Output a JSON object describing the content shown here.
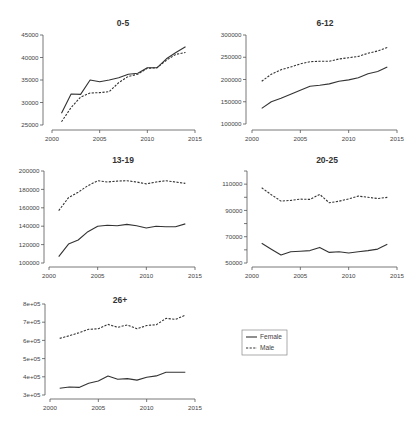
{
  "colors": {
    "background": "#ffffff",
    "line": "#333333",
    "axis": "#555555",
    "text": "#333333"
  },
  "legend": {
    "entries": [
      {
        "label": "Female",
        "style": "solid"
      },
      {
        "label": "Male",
        "style": "dashed"
      }
    ]
  },
  "chart_data": [
    {
      "type": "line",
      "title": "0-5",
      "xlabel": "",
      "ylabel": "",
      "x": [
        2001,
        2002,
        2003,
        2004,
        2005,
        2006,
        2007,
        2008,
        2009,
        2010,
        2011,
        2012,
        2013,
        2014
      ],
      "series": [
        {
          "name": "Female",
          "style": "solid",
          "values": [
            27600,
            31900,
            31800,
            35000,
            34600,
            35000,
            35500,
            36300,
            36500,
            37700,
            37700,
            39700,
            41100,
            42400
          ]
        },
        {
          "name": "Male",
          "style": "dashed",
          "values": [
            25700,
            28900,
            31200,
            32100,
            32200,
            32400,
            34400,
            35800,
            36300,
            37600,
            37700,
            39400,
            40700,
            41100
          ]
        }
      ],
      "xlim": [
        2000,
        2015
      ],
      "ylim": [
        25000,
        45000
      ],
      "x_ticks": [
        2000,
        2005,
        2010,
        2015
      ],
      "x_tick_labels": [
        "2000",
        "2005",
        "2010",
        "2015"
      ],
      "y_ticks": [
        25000,
        30000,
        35000,
        40000,
        45000
      ],
      "y_tick_labels": [
        "25000",
        "30000",
        "35000",
        "40000",
        "45000"
      ],
      "grid": false
    },
    {
      "type": "line",
      "title": "6-12",
      "xlabel": "",
      "ylabel": "",
      "x": [
        2001,
        2002,
        2003,
        2004,
        2005,
        2006,
        2007,
        2008,
        2009,
        2010,
        2011,
        2012,
        2013,
        2014
      ],
      "series": [
        {
          "name": "Female",
          "style": "solid",
          "values": [
            135000,
            150000,
            158000,
            167000,
            176000,
            185000,
            187000,
            190000,
            196000,
            199000,
            204000,
            213000,
            218000,
            228000
          ]
        },
        {
          "name": "Male",
          "style": "dashed",
          "values": [
            196000,
            212000,
            222000,
            228000,
            235000,
            240000,
            241000,
            241000,
            246000,
            249000,
            252000,
            259000,
            264000,
            272000
          ]
        }
      ],
      "xlim": [
        2000,
        2015
      ],
      "ylim": [
        100000,
        300000
      ],
      "x_ticks": [
        2000,
        2005,
        2010,
        2015
      ],
      "x_tick_labels": [
        "2000",
        "2005",
        "2010",
        "2015"
      ],
      "y_ticks": [
        100000,
        150000,
        200000,
        250000,
        300000
      ],
      "y_tick_labels": [
        "100000",
        "150000",
        "200000",
        "250000",
        "300000"
      ],
      "grid": false
    },
    {
      "type": "line",
      "title": "13-19",
      "xlabel": "",
      "ylabel": "",
      "x": [
        2001,
        2002,
        2003,
        2004,
        2005,
        2006,
        2007,
        2008,
        2009,
        2010,
        2011,
        2012,
        2013,
        2014
      ],
      "series": [
        {
          "name": "Female",
          "style": "solid",
          "values": [
            107000,
            120500,
            125000,
            134000,
            140000,
            141000,
            140500,
            142000,
            140500,
            138000,
            140000,
            139500,
            139500,
            142500
          ]
        },
        {
          "name": "Male",
          "style": "dashed",
          "values": [
            157000,
            171000,
            177000,
            184000,
            189500,
            188000,
            189000,
            189500,
            188000,
            186000,
            188000,
            189500,
            188000,
            186500
          ]
        }
      ],
      "xlim": [
        2000,
        2015
      ],
      "ylim": [
        100000,
        200000
      ],
      "x_ticks": [
        2000,
        2005,
        2010,
        2015
      ],
      "x_tick_labels": [
        "2000",
        "2005",
        "2010",
        "2015"
      ],
      "y_ticks": [
        100000,
        120000,
        140000,
        160000,
        180000,
        200000
      ],
      "y_tick_labels": [
        "100000",
        "120000",
        "140000",
        "160000",
        "180000",
        "200000"
      ],
      "grid": false
    },
    {
      "type": "line",
      "title": "20-25",
      "xlabel": "",
      "ylabel": "",
      "x": [
        2001,
        2002,
        2003,
        2004,
        2005,
        2006,
        2007,
        2008,
        2009,
        2010,
        2011,
        2012,
        2013,
        2014
      ],
      "series": [
        {
          "name": "Female",
          "style": "solid",
          "values": [
            65000,
            60500,
            56100,
            58600,
            59000,
            59400,
            61900,
            58100,
            58600,
            57600,
            58500,
            59400,
            60600,
            64200
          ]
        },
        {
          "name": "Male",
          "style": "dashed",
          "values": [
            107200,
            102000,
            97100,
            97600,
            98600,
            98400,
            102200,
            95800,
            97000,
            98800,
            100900,
            100000,
            99100,
            99900
          ]
        }
      ],
      "xlim": [
        2000,
        2015
      ],
      "ylim": [
        50000,
        120000
      ],
      "x_ticks": [
        2000,
        2005,
        2010,
        2015
      ],
      "x_tick_labels": [
        "2000",
        "2005",
        "2010",
        "2015"
      ],
      "y_ticks": [
        50000,
        60000,
        70000,
        80000,
        90000,
        100000,
        110000,
        120000
      ],
      "y_tick_labels": [
        "50000",
        "",
        "70000",
        "",
        "90000",
        "",
        "110000",
        ""
      ],
      "grid": false
    },
    {
      "type": "line",
      "title": "26+",
      "xlabel": "",
      "ylabel": "",
      "x": [
        2001,
        2002,
        2003,
        2004,
        2005,
        2006,
        2007,
        2008,
        2009,
        2010,
        2011,
        2012,
        2013,
        2014
      ],
      "series": [
        {
          "name": "Female",
          "style": "solid",
          "values": [
            337000,
            344000,
            342000,
            365000,
            377000,
            404000,
            386000,
            390000,
            382000,
            397000,
            405000,
            425000,
            425000,
            425000
          ]
        },
        {
          "name": "Male",
          "style": "dashed",
          "values": [
            611000,
            626000,
            642000,
            661000,
            664000,
            688000,
            672000,
            685000,
            664000,
            682000,
            686000,
            721000,
            716000,
            739000
          ]
        }
      ],
      "xlim": [
        2000,
        2015
      ],
      "ylim": [
        300000,
        800000
      ],
      "x_ticks": [
        2000,
        2005,
        2010,
        2015
      ],
      "x_tick_labels": [
        "2000",
        "2005",
        "2010",
        "2015"
      ],
      "y_ticks": [
        300000,
        400000,
        500000,
        600000,
        700000,
        800000
      ],
      "y_tick_labels": [
        "3e+05",
        "4e+05",
        "5e+05",
        "6e+05",
        "7e+05",
        "8e+05"
      ],
      "grid": false
    }
  ]
}
